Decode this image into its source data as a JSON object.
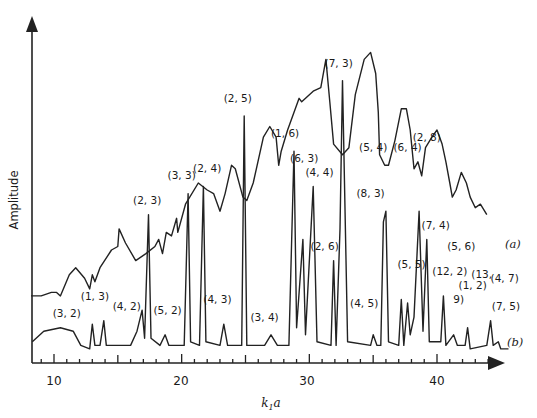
{
  "chart_data": {
    "type": "line",
    "title": "",
    "xlabel": "k₁a",
    "ylabel": "Amplitude",
    "xlim": [
      8.2,
      45
    ],
    "ylim": [
      0,
      1
    ],
    "xticks_major": [
      10,
      20,
      30,
      40
    ],
    "xticks_major_labels": [
      "10",
      "20",
      "30",
      "40"
    ],
    "xticks_minor_step": 1,
    "grid": false,
    "legend": "inline curve labels at right end",
    "series": [
      {
        "name": "(a)",
        "label": "(a)",
        "description": "Upper continuous spectrum with broad peaks and sharp dips at resonance positions",
        "points": [
          [
            8.2,
            0.19
          ],
          [
            9,
            0.19
          ],
          [
            9.8,
            0.2
          ],
          [
            10.2,
            0.2
          ],
          [
            10.5,
            0.19
          ],
          [
            11.2,
            0.25
          ],
          [
            11.7,
            0.27
          ],
          [
            12.4,
            0.24
          ],
          [
            12.8,
            0.21
          ],
          [
            13,
            0.25
          ],
          [
            13.2,
            0.23
          ],
          [
            13.6,
            0.27
          ],
          [
            14.5,
            0.32
          ],
          [
            15,
            0.33
          ],
          [
            15.1,
            0.38
          ],
          [
            15.6,
            0.34
          ],
          [
            16.4,
            0.29
          ],
          [
            17.2,
            0.31
          ],
          [
            17.9,
            0.33
          ],
          [
            18.2,
            0.35
          ],
          [
            18.5,
            0.31
          ],
          [
            18.8,
            0.37
          ],
          [
            19.2,
            0.36
          ],
          [
            19.6,
            0.41
          ],
          [
            19.7,
            0.37
          ],
          [
            20.3,
            0.45
          ],
          [
            21.3,
            0.51
          ],
          [
            22,
            0.49
          ],
          [
            22.5,
            0.48
          ],
          [
            23,
            0.43
          ],
          [
            23.4,
            0.48
          ],
          [
            23.9,
            0.56
          ],
          [
            24.2,
            0.55
          ],
          [
            24.8,
            0.47
          ],
          [
            25.1,
            0.46
          ],
          [
            25.6,
            0.51
          ],
          [
            26.4,
            0.64
          ],
          [
            26.9,
            0.67
          ],
          [
            27.4,
            0.64
          ],
          [
            27.6,
            0.56
          ],
          [
            27.8,
            0.6
          ],
          [
            28.3,
            0.66
          ],
          [
            29.2,
            0.75
          ],
          [
            29.4,
            0.74
          ],
          [
            30.3,
            0.77
          ],
          [
            30.9,
            0.78
          ],
          [
            31.3,
            0.86
          ],
          [
            31.6,
            0.74
          ],
          [
            31.9,
            0.62
          ],
          [
            32.6,
            0.59
          ],
          [
            33.1,
            0.61
          ],
          [
            33.6,
            0.76
          ],
          [
            34.3,
            0.86
          ],
          [
            34.8,
            0.88
          ],
          [
            35.2,
            0.82
          ],
          [
            35.4,
            0.71
          ],
          [
            35.5,
            0.59
          ],
          [
            35.9,
            0.56
          ],
          [
            36.2,
            0.56
          ],
          [
            36.7,
            0.63
          ],
          [
            37.2,
            0.72
          ],
          [
            37.6,
            0.72
          ],
          [
            37.9,
            0.66
          ],
          [
            38.2,
            0.55
          ],
          [
            38.5,
            0.57
          ],
          [
            38.8,
            0.53
          ],
          [
            39.1,
            0.61
          ],
          [
            39.6,
            0.64
          ],
          [
            40,
            0.66
          ],
          [
            40.4,
            0.62
          ],
          [
            40.7,
            0.57
          ],
          [
            41,
            0.51
          ],
          [
            41.2,
            0.47
          ],
          [
            41.5,
            0.49
          ],
          [
            41.9,
            0.54
          ],
          [
            42.3,
            0.51
          ],
          [
            42.6,
            0.47
          ],
          [
            43,
            0.44
          ],
          [
            43.4,
            0.45
          ],
          [
            43.9,
            0.42
          ]
        ]
      },
      {
        "name": "(b)",
        "label": "(b)",
        "description": "Lower resonance spectrum with sharp labeled peaks",
        "points": [
          [
            8.3,
            0.06
          ],
          [
            9.2,
            0.09
          ],
          [
            10.5,
            0.1
          ],
          [
            11.5,
            0.09
          ],
          [
            12.1,
            0.05
          ],
          [
            12.8,
            0.04
          ],
          [
            13,
            0.11
          ],
          [
            13.2,
            0.05
          ],
          [
            13.6,
            0.05
          ],
          [
            13.9,
            0.12
          ],
          [
            14.1,
            0.05
          ],
          [
            16,
            0.05
          ],
          [
            16.5,
            0.09
          ],
          [
            16.9,
            0.15
          ],
          [
            17.1,
            0.07
          ],
          [
            17.4,
            0.42
          ],
          [
            17.6,
            0.07
          ],
          [
            18.3,
            0.05
          ],
          [
            18.7,
            0.08
          ],
          [
            19,
            0.05
          ],
          [
            20.2,
            0.05
          ],
          [
            20.5,
            0.48
          ],
          [
            20.7,
            0.06
          ],
          [
            21.4,
            0.05
          ],
          [
            21.7,
            0.5
          ],
          [
            21.9,
            0.06
          ],
          [
            23,
            0.05
          ],
          [
            23.3,
            0.11
          ],
          [
            23.6,
            0.05
          ],
          [
            24.7,
            0.05
          ],
          [
            24.9,
            0.7
          ],
          [
            25.1,
            0.05
          ],
          [
            26.5,
            0.05
          ],
          [
            27,
            0.08
          ],
          [
            27.5,
            0.05
          ],
          [
            28.4,
            0.05
          ],
          [
            28.8,
            0.6
          ],
          [
            29,
            0.1
          ],
          [
            29.5,
            0.35
          ],
          [
            29.7,
            0.08
          ],
          [
            30.3,
            0.5
          ],
          [
            30.6,
            0.06
          ],
          [
            31.7,
            0.05
          ],
          [
            31.9,
            0.29
          ],
          [
            32.1,
            0.05
          ],
          [
            32.4,
            0.38
          ],
          [
            32.6,
            0.8
          ],
          [
            33,
            0.06
          ],
          [
            34.8,
            0.05
          ],
          [
            35,
            0.08
          ],
          [
            35.3,
            0.05
          ],
          [
            35.6,
            0.05
          ],
          [
            35.8,
            0.4
          ],
          [
            36.0,
            0.43
          ],
          [
            36.2,
            0.06
          ],
          [
            37,
            0.05
          ],
          [
            37.2,
            0.18
          ],
          [
            37.4,
            0.05
          ],
          [
            37.7,
            0.17
          ],
          [
            37.9,
            0.08
          ],
          [
            38.2,
            0.13
          ],
          [
            38.6,
            0.43
          ],
          [
            38.9,
            0.09
          ],
          [
            39.2,
            0.35
          ],
          [
            39.4,
            0.06
          ],
          [
            40.3,
            0.06
          ],
          [
            40.5,
            0.19
          ],
          [
            40.7,
            0.05
          ],
          [
            41.3,
            0.08
          ],
          [
            41.6,
            0.05
          ],
          [
            42.2,
            0.05
          ],
          [
            42.4,
            0.1
          ],
          [
            42.6,
            0.04
          ],
          [
            43.9,
            0.05
          ],
          [
            44.2,
            0.12
          ],
          [
            44.4,
            0.05
          ],
          [
            44.8,
            0.06
          ],
          [
            45,
            0.04
          ],
          [
            45.6,
            0.04
          ]
        ]
      }
    ],
    "annotations": [
      {
        "text": "(3, 2)",
        "x": 11.0,
        "y": 0.13
      },
      {
        "text": "(1, 3)",
        "x": 13.2,
        "y": 0.18
      },
      {
        "text": "(4, 2)",
        "x": 15.7,
        "y": 0.15
      },
      {
        "text": "(5, 2)",
        "x": 18.9,
        "y": 0.14
      },
      {
        "text": "(2, 3)",
        "x": 17.3,
        "y": 0.45
      },
      {
        "text": "(3, 3)",
        "x": 20.0,
        "y": 0.52
      },
      {
        "text": "(2, 4)",
        "x": 22.0,
        "y": 0.54
      },
      {
        "text": "(4, 3)",
        "x": 22.8,
        "y": 0.17
      },
      {
        "text": "(2, 5)",
        "x": 24.4,
        "y": 0.74
      },
      {
        "text": "(3, 4)",
        "x": 26.5,
        "y": 0.12
      },
      {
        "text": "(1, 6)",
        "x": 28.1,
        "y": 0.64
      },
      {
        "text": "(6, 3)",
        "x": 29.6,
        "y": 0.57
      },
      {
        "text": "(4, 4)",
        "x": 30.8,
        "y": 0.53
      },
      {
        "text": "(2, 6)",
        "x": 31.2,
        "y": 0.32
      },
      {
        "text": "(7, 3)",
        "x": 32.3,
        "y": 0.84
      },
      {
        "text": "(5, 4)",
        "x": 35.0,
        "y": 0.6
      },
      {
        "text": "(8, 3)",
        "x": 34.8,
        "y": 0.47
      },
      {
        "text": "(4, 5)",
        "x": 34.3,
        "y": 0.16
      },
      {
        "text": "(5, 5)",
        "x": 38.0,
        "y": 0.27
      },
      {
        "text": "(6, 4)",
        "x": 37.7,
        "y": 0.6
      },
      {
        "text": "(2, 8)",
        "x": 39.2,
        "y": 0.63
      },
      {
        "text": "(7, 4)",
        "x": 39.9,
        "y": 0.38
      },
      {
        "text": "(5, 6)",
        "x": 41.9,
        "y": 0.32
      },
      {
        "text": "(12, 2)",
        "x": 41.0,
        "y": 0.25
      },
      {
        "text": "(1, 2)",
        "x": 42.8,
        "y": 0.21
      },
      {
        "text": "9)",
        "x": 41.7,
        "y": 0.17
      },
      {
        "text": "(13,",
        "x": 43.5,
        "y": 0.24
      },
      {
        "text": "(4, 7)",
        "x": 45.3,
        "y": 0.23
      },
      {
        "text": "(7, 5)",
        "x": 45.4,
        "y": 0.15
      }
    ]
  },
  "axes": {
    "y_label": "Amplitude",
    "x_label_main": "k",
    "x_label_sub": "1",
    "x_label_tail": "a",
    "tick_10": "10",
    "tick_20": "20",
    "tick_30": "30",
    "tick_40": "40"
  },
  "series_labels": {
    "a": "(a)",
    "b": "(b)"
  }
}
